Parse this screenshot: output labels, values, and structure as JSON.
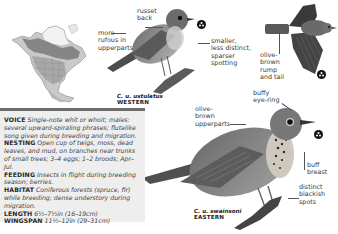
{
  "map": {
    "name": "range-map-north-america"
  },
  "western": {
    "labels": {
      "russet_back": [
        "russet",
        "back"
      ],
      "more_rufous": [
        "more",
        "rufous in",
        "upperparts"
      ],
      "spotting": [
        "smaller,",
        "less distinct,",
        "sparser",
        "spotting"
      ]
    },
    "caption": {
      "scientific": "C. u. ustulatus",
      "population": "WESTERN"
    }
  },
  "flight": {
    "labels": {
      "rump_tail": [
        "olive-",
        "brown",
        "rump",
        "and tail"
      ]
    }
  },
  "eastern": {
    "labels": {
      "eye_ring": [
        "buffy",
        "eye-ring"
      ],
      "upperparts": [
        "olive-",
        "brown",
        "upperparts"
      ],
      "breast": [
        "buff",
        "breast"
      ],
      "spots": [
        "distinct",
        "blackish",
        "spots"
      ]
    },
    "caption": {
      "scientific": "C. u. swainsoni",
      "population": "EASTERN"
    }
  },
  "info": [
    {
      "key": "VOICE",
      "value": "Single-note whit or whoit; males: several upward-spiraling phrases; flutelike song given during breeding and migration."
    },
    {
      "key": "NESTING",
      "value": "Open cup of twigs, moss, dead leaves, and mud, on branches near trunks of small trees; 3–4 eggs; 1–2 broods; Apr–Jul."
    },
    {
      "key": "FEEDING",
      "value": "Insects in flight during breeding season; berries."
    },
    {
      "key": "HABITAT",
      "value": "Coniferous forests (spruce, fir) while breeding; dense understory during migration."
    },
    {
      "key": "LENGTH",
      "value": "6½–7½in (16–19cm)"
    },
    {
      "key": "WINGSPAN",
      "value": "11½–12in (29–31cm)"
    }
  ]
}
